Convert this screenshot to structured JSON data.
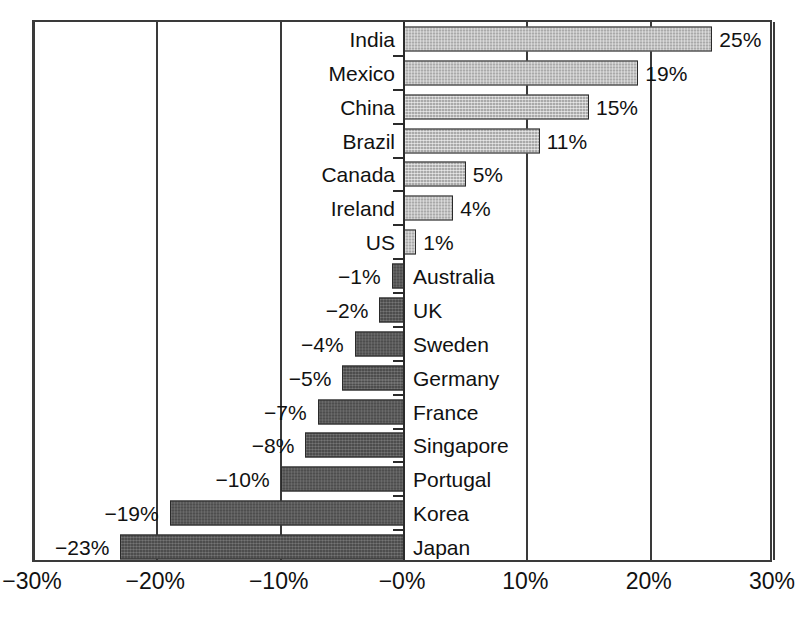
{
  "chart_data": {
    "type": "bar",
    "orientation": "horizontal",
    "title": "",
    "subtitle": "",
    "xlabel": "",
    "ylabel": "",
    "xlim": [
      -30,
      30
    ],
    "grid": true,
    "legend": null,
    "value_suffix": "%",
    "xticks": [
      -30,
      -20,
      -10,
      0,
      10,
      20,
      30
    ],
    "xtick_labels": [
      "−30%",
      "−20%",
      "−10%",
      "−0%",
      "10%",
      "20%",
      "30%"
    ],
    "categories": [
      "India",
      "Mexico",
      "China",
      "Brazil",
      "Canada",
      "Ireland",
      "US",
      "Australia",
      "UK",
      "Sweden",
      "Germany",
      "France",
      "Singapore",
      "Portugal",
      "Korea",
      "Japan"
    ],
    "values": [
      25,
      19,
      15,
      11,
      5,
      4,
      1,
      -1,
      -2,
      -4,
      -5,
      -7,
      -8,
      -10,
      -19,
      -23
    ],
    "data_labels": [
      "25%",
      "19%",
      "15%",
      "11%",
      "5%",
      "4%",
      "1%",
      "−1%",
      "−2%",
      "−4%",
      "−5%",
      "−7%",
      "−8%",
      "−10%",
      "−19%",
      "−23%"
    ],
    "colors": {
      "positive_bar": "#a9a9a9",
      "negative_bar": "#4d4d4d",
      "bar_outline": "#2a2a2a",
      "axis": "#3a3a3a",
      "text": "#111111",
      "background": "#ffffff"
    }
  }
}
